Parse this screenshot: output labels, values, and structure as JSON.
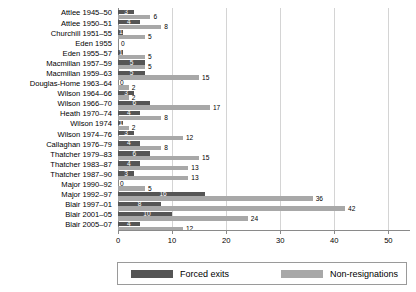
{
  "chart_data": {
    "type": "bar",
    "orientation": "horizontal",
    "title": "",
    "subtitle": "",
    "xlabel": "",
    "ylabel": "",
    "xlim": [
      0,
      54
    ],
    "xticks": [
      0,
      10,
      20,
      30,
      40,
      50
    ],
    "grid": true,
    "legend_position": "bottom",
    "categories": [
      "Attlee 1945–50",
      "Attlee 1950–51",
      "Churchill 1951–55",
      "Eden 1955",
      "Eden 1955–57",
      "Macmillan 1957–59",
      "Macmillan 1959–63",
      "Douglas-Home 1963–64",
      "Wilson 1964–66",
      "Wilson 1966–70",
      "Heath 1970–74",
      "Wilson 1974",
      "Wilson 1974–76",
      "Callaghan 1976–79",
      "Thatcher 1979–83",
      "Thatcher 1983–87",
      "Thatcher 1987–90",
      "Major 1990–92",
      "Major 1992–97",
      "Blair 1997–01",
      "Blair 2001–05",
      "Blair 2005–07"
    ],
    "series": [
      {
        "name": "Forced exits",
        "color": "#555555",
        "values": [
          3,
          4,
          1,
          0,
          1,
          5,
          5,
          0,
          3,
          6,
          4,
          1,
          3,
          4,
          6,
          4,
          3,
          0,
          16,
          8,
          10,
          4
        ]
      },
      {
        "name": "Non-resignations",
        "color": "#a8a8a8",
        "values": [
          6,
          8,
          5,
          null,
          5,
          5,
          15,
          2,
          2,
          17,
          8,
          2,
          12,
          8,
          15,
          13,
          13,
          5,
          36,
          42,
          24,
          12
        ]
      }
    ]
  },
  "legend": {
    "items": [
      {
        "label": "Forced exits",
        "color": "#555555"
      },
      {
        "label": "Non-resignations",
        "color": "#a8a8a8"
      }
    ]
  }
}
